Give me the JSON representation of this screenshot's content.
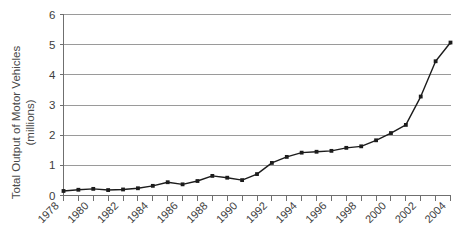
{
  "chart_data": {
    "type": "line",
    "title": "",
    "xlabel": "",
    "ylabel": "Total Output of Motor Vehicles (millions)",
    "ylabel_lines": [
      "Total Output of Motor Vehicles",
      "(millions)"
    ],
    "grid": true,
    "legend": "none",
    "xlim": [
      1978,
      2004
    ],
    "ylim": [
      0,
      6
    ],
    "yticks": [
      0,
      1,
      2,
      3,
      4,
      5,
      6
    ],
    "ytick_labels": [
      "0",
      "1",
      "2",
      "3",
      "4",
      "5",
      "6"
    ],
    "xtick_labels": [
      "1978",
      "1980",
      "1982",
      "1984",
      "1986",
      "1988",
      "1990",
      "1992",
      "1994",
      "1996",
      "1998",
      "2000",
      "2002",
      "2004"
    ],
    "xtick_label_step": 2,
    "marker": "square",
    "x": [
      1978,
      1979,
      1980,
      1981,
      1982,
      1983,
      1984,
      1985,
      1986,
      1987,
      1988,
      1989,
      1990,
      1991,
      1992,
      1993,
      1994,
      1995,
      1996,
      1997,
      1998,
      1999,
      2000,
      2001,
      2002,
      2003,
      2004
    ],
    "values": [
      0.15,
      0.19,
      0.22,
      0.18,
      0.2,
      0.24,
      0.32,
      0.44,
      0.37,
      0.48,
      0.65,
      0.59,
      0.51,
      0.71,
      1.08,
      1.28,
      1.42,
      1.45,
      1.48,
      1.58,
      1.63,
      1.83,
      2.07,
      2.34,
      3.28,
      4.45,
      5.07
    ],
    "series": [
      {
        "name": "Total Output of Motor Vehicles",
        "values": [
          0.15,
          0.19,
          0.22,
          0.18,
          0.2,
          0.24,
          0.32,
          0.44,
          0.37,
          0.48,
          0.65,
          0.59,
          0.51,
          0.71,
          1.08,
          1.28,
          1.42,
          1.45,
          1.48,
          1.58,
          1.63,
          1.83,
          2.07,
          2.34,
          3.28,
          4.45,
          5.07
        ],
        "color": "#1c1c1c"
      }
    ]
  },
  "colors": {
    "line": "#1c1c1c",
    "grid": "#9a9a9a",
    "axis": "#6f6f6f",
    "text": "#3d3d3d",
    "background": "#ffffff"
  }
}
